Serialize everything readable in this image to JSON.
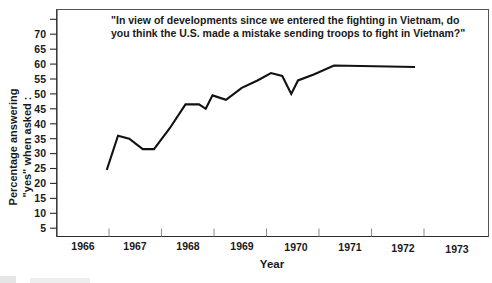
{
  "chart_data": {
    "type": "line",
    "title": "\"In view of developments since we entered the fighting in Vietnam, do you think the U.S. made a mistake sending troops to fight in Vietnam?\"",
    "title_line1": "\"In view of developments since we entered the fighting in Vietnam, do",
    "title_line2": "you think the U.S. made a mistake sending troops to fight in Vietnam?\"",
    "xlabel": "Year",
    "ylabel": "Percentage answering \"yes\" when asked :",
    "ylabel_line1": "Percentage answering",
    "ylabel_line2": "\"yes\" when asked :",
    "xlim": [
      1965.7,
      1973.0
    ],
    "ylim": [
      2.5,
      75.0
    ],
    "grid": false,
    "legend": "none",
    "ytick_labels": [
      "5",
      "10",
      "15",
      "20",
      "25",
      "30",
      "35",
      "40",
      "45",
      "50",
      "55",
      "60",
      "65",
      "70"
    ],
    "ytick_values": [
      5,
      10,
      15,
      20,
      25,
      30,
      35,
      40,
      45,
      50,
      55,
      60,
      65,
      70,
      75
    ],
    "xtick_labels": [
      "1966",
      "1967",
      "1968",
      "1969",
      "1970",
      "1971",
      "1972",
      "1973"
    ],
    "xtick_values": [
      1966,
      1967,
      1968,
      1969,
      1970,
      1971,
      1972,
      1973
    ],
    "series": [
      {
        "name": "Percentage answering yes",
        "x": [
          1965.95,
          1966.2,
          1966.45,
          1966.75,
          1967.0,
          1967.35,
          1967.7,
          1968.0,
          1968.15,
          1968.3,
          1968.6,
          1968.95,
          1969.3,
          1969.6,
          1969.85,
          1970.05,
          1970.2,
          1970.55,
          1971.0,
          1972.8
        ],
        "y": [
          24.5,
          36.0,
          35.0,
          31.5,
          31.5,
          38.5,
          46.5,
          46.5,
          45.0,
          49.5,
          48.0,
          52.0,
          54.5,
          57.0,
          56.0,
          50.0,
          54.5,
          56.5,
          59.5,
          59.0
        ],
        "color": "#111111"
      }
    ],
    "axis_color": "#2b2b2b",
    "frame_color": "#555555",
    "background": "#ffffff"
  }
}
